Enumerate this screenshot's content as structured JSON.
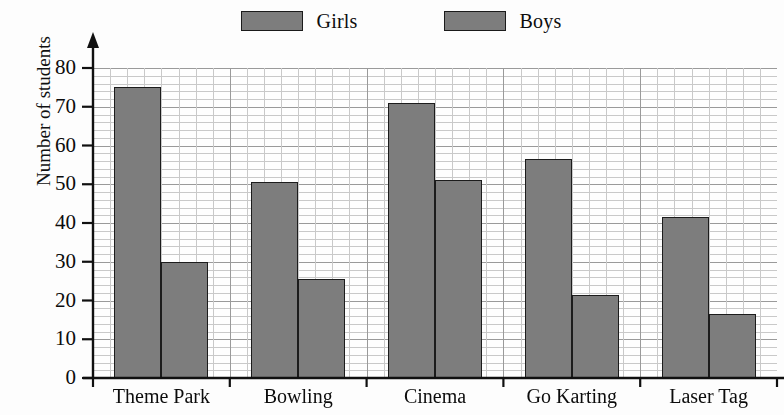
{
  "chart_data": {
    "type": "bar",
    "title": "",
    "subtitle": "",
    "xlabel": "",
    "ylabel": "Number of students",
    "categories": [
      "Theme Park",
      "Bowling",
      "Cinema",
      "Go Karting",
      "Laser Tag"
    ],
    "series": [
      {
        "name": "Girls",
        "values": [
          75,
          50.5,
          71,
          56.5,
          41.5
        ],
        "color": "#7d7d7d"
      },
      {
        "name": "Boys",
        "values": [
          30,
          25.5,
          51,
          21.5,
          16.5
        ],
        "color": "#7d7d7d"
      }
    ],
    "ylim": [
      0,
      80
    ],
    "y_ticks": [
      0,
      10,
      20,
      30,
      40,
      50,
      60,
      70,
      80
    ],
    "y_tick_labels": [
      "0",
      "10",
      "20",
      "30",
      "40",
      "50",
      "60",
      "70",
      "80"
    ],
    "y_minor_step": 2,
    "grid": true,
    "grid_style": "graph-paper",
    "legend": {
      "position": "top-center",
      "entries": [
        {
          "label": "Girls",
          "swatch_color": "#7d7d7d"
        },
        {
          "label": "Boys",
          "swatch_color": "#7d7d7d"
        }
      ]
    },
    "axis_arrow_y": true,
    "bar_edge_color": "#1c1c1c",
    "background_color": "#fdfdfd"
  }
}
